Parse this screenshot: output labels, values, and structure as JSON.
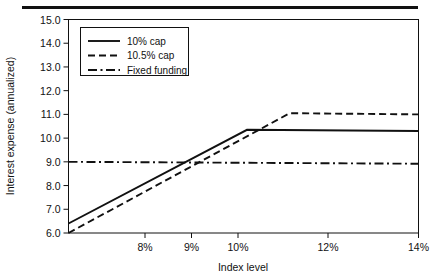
{
  "figure": {
    "has_top_rule": true,
    "background_color": "#ffffff",
    "ink_color": "#111111"
  },
  "chart_data": {
    "type": "line",
    "title": "",
    "xlabel": "Index level",
    "ylabel": "Interest expense (annualized)",
    "xlim": [
      6.35,
      14.0
    ],
    "ylim": [
      6.0,
      15.0
    ],
    "grid": false,
    "legend_position": "upper-left-inside",
    "x_ticks": [
      {
        "value": 8,
        "label": "8%"
      },
      {
        "value": 9,
        "label": "9%"
      },
      {
        "value": 10,
        "label": "10%"
      },
      {
        "value": 12,
        "label": "12%"
      },
      {
        "value": 14,
        "label": "14%"
      }
    ],
    "x_tick_labels": [
      "8%",
      "9%",
      "10%",
      "12%",
      "14%"
    ],
    "y_ticks": [
      6,
      7,
      8,
      9,
      10,
      11,
      12,
      13,
      14,
      15
    ],
    "y_tick_labels": [
      "6.0",
      "7.0",
      "8.0",
      "9.0",
      "10.0",
      "11.0",
      "12.0",
      "13.0",
      "14.0",
      "15.0"
    ],
    "series": [
      {
        "name": "10% cap",
        "style": "solid",
        "color": "#111111",
        "points": [
          {
            "x": 6.35,
            "y": 6.4
          },
          {
            "x": 10.2,
            "y": 10.35
          },
          {
            "x": 14.0,
            "y": 10.3
          }
        ]
      },
      {
        "name": "10.5% cap",
        "style": "dashed",
        "color": "#111111",
        "points": [
          {
            "x": 6.35,
            "y": 6.0
          },
          {
            "x": 11.15,
            "y": 11.05
          },
          {
            "x": 14.0,
            "y": 11.0
          }
        ]
      },
      {
        "name": "Fixed funding",
        "style": "dashdot",
        "color": "#111111",
        "points": [
          {
            "x": 6.35,
            "y": 9.0
          },
          {
            "x": 14.0,
            "y": 8.92
          }
        ]
      }
    ]
  },
  "legend": {
    "entries": [
      {
        "label": "10% cap",
        "style": "solid"
      },
      {
        "label": "10.5% cap",
        "style": "dashed"
      },
      {
        "label": "Fixed funding",
        "style": "dashdot"
      }
    ]
  }
}
